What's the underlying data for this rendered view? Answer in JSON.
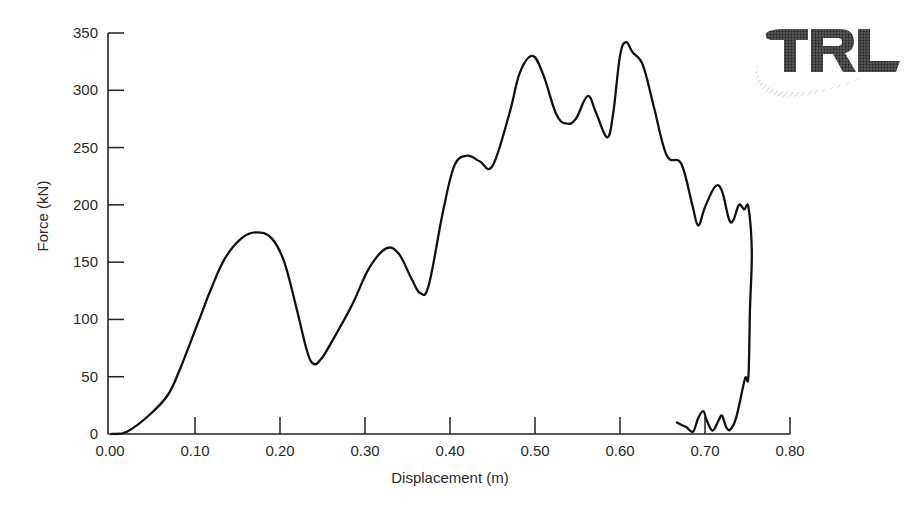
{
  "chart_data": {
    "type": "line",
    "title": "",
    "xlabel": "Displacement (m)",
    "ylabel": "Force (kN)",
    "xlim": [
      0.0,
      0.8
    ],
    "ylim": [
      0,
      350
    ],
    "grid": false,
    "legend": null,
    "xticks": [
      "0.00",
      "0.10",
      "0.20",
      "0.30",
      "0.40",
      "0.50",
      "0.60",
      "0.70",
      "0.80"
    ],
    "yticks": [
      "0",
      "50",
      "100",
      "150",
      "200",
      "250",
      "300",
      "350"
    ],
    "series": [
      {
        "name": "Force-displacement",
        "color": "#111111",
        "points": [
          [
            0.002,
            0
          ],
          [
            0.02,
            2
          ],
          [
            0.047,
            17
          ],
          [
            0.068,
            34
          ],
          [
            0.082,
            56
          ],
          [
            0.105,
            100
          ],
          [
            0.118,
            125
          ],
          [
            0.135,
            153
          ],
          [
            0.155,
            171
          ],
          [
            0.172,
            176
          ],
          [
            0.19,
            171
          ],
          [
            0.205,
            150
          ],
          [
            0.22,
            108
          ],
          [
            0.232,
            72
          ],
          [
            0.24,
            61
          ],
          [
            0.25,
            67
          ],
          [
            0.262,
            82
          ],
          [
            0.285,
            113
          ],
          [
            0.305,
            145
          ],
          [
            0.325,
            162
          ],
          [
            0.34,
            157
          ],
          [
            0.355,
            135
          ],
          [
            0.365,
            123
          ],
          [
            0.375,
            130
          ],
          [
            0.392,
            195
          ],
          [
            0.405,
            234
          ],
          [
            0.42,
            243
          ],
          [
            0.435,
            238
          ],
          [
            0.45,
            234
          ],
          [
            0.47,
            280
          ],
          [
            0.482,
            315
          ],
          [
            0.497,
            330
          ],
          [
            0.51,
            313
          ],
          [
            0.525,
            279
          ],
          [
            0.537,
            271
          ],
          [
            0.548,
            275
          ],
          [
            0.562,
            295
          ],
          [
            0.572,
            280
          ],
          [
            0.585,
            259
          ],
          [
            0.592,
            280
          ],
          [
            0.6,
            330
          ],
          [
            0.607,
            342
          ],
          [
            0.615,
            333
          ],
          [
            0.627,
            322
          ],
          [
            0.64,
            285
          ],
          [
            0.655,
            243
          ],
          [
            0.672,
            236
          ],
          [
            0.685,
            200
          ],
          [
            0.692,
            182
          ],
          [
            0.7,
            198
          ],
          [
            0.712,
            216
          ],
          [
            0.72,
            212
          ],
          [
            0.728,
            188
          ],
          [
            0.733,
            186
          ],
          [
            0.74,
            200
          ],
          [
            0.746,
            196
          ],
          [
            0.751,
            198
          ],
          [
            0.755,
            160
          ],
          [
            0.753,
            110
          ],
          [
            0.751,
            50
          ],
          [
            0.747,
            48
          ],
          [
            0.737,
            15
          ],
          [
            0.73,
            4
          ],
          [
            0.725,
            6
          ],
          [
            0.72,
            16
          ],
          [
            0.716,
            12
          ],
          [
            0.709,
            3
          ],
          [
            0.702,
            12
          ],
          [
            0.698,
            20
          ],
          [
            0.692,
            14
          ],
          [
            0.686,
            2
          ],
          [
            0.678,
            6
          ],
          [
            0.672,
            8
          ],
          [
            0.667,
            10
          ]
        ]
      }
    ],
    "annotations": [
      "TRL logo (top right)"
    ]
  },
  "logo": {
    "text": "TRL",
    "color": "#3a3a3a"
  }
}
